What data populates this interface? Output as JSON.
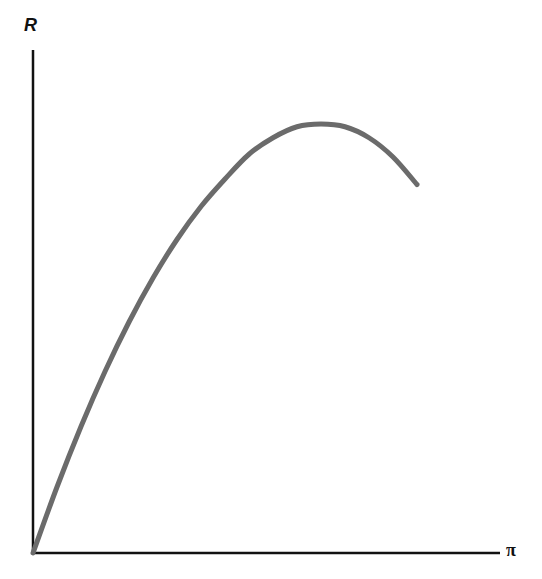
{
  "chart_data": {
    "type": "line",
    "title": "",
    "xlabel": "π",
    "ylabel": "R",
    "x_ticks": [],
    "y_ticks": [],
    "grid": false,
    "legend": null,
    "series": [
      {
        "name": "R vs π",
        "color": "#6b6b6b",
        "points": [
          [
            0.0,
            0.0
          ],
          [
            0.05,
            0.12
          ],
          [
            0.1,
            0.23
          ],
          [
            0.15,
            0.33
          ],
          [
            0.2,
            0.42
          ],
          [
            0.25,
            0.5
          ],
          [
            0.3,
            0.57
          ],
          [
            0.35,
            0.63
          ],
          [
            0.4,
            0.68
          ],
          [
            0.45,
            0.725
          ],
          [
            0.5,
            0.755
          ],
          [
            0.55,
            0.775
          ],
          [
            0.6,
            0.78
          ],
          [
            0.65,
            0.775
          ],
          [
            0.7,
            0.755
          ],
          [
            0.75,
            0.72
          ],
          [
            0.8,
            0.67
          ]
        ]
      }
    ],
    "xlim": [
      0,
      1
    ],
    "ylim": [
      0,
      1
    ]
  }
}
